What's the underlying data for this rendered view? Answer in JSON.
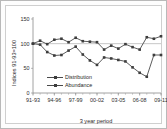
{
  "chart_data": {
    "type": "line",
    "title": "",
    "subtitle": "",
    "xlabel": "3 year period",
    "ylabel": "Indices 91-93=100",
    "ylim": [
      0,
      150
    ],
    "yticks": [
      0,
      50,
      100,
      150
    ],
    "ytick_labels": [
      "0",
      "50",
      "100",
      "150"
    ],
    "xtick_labels": [
      "91-93",
      "94-96",
      "97-99",
      "00-02",
      "03-05",
      "06-08",
      "09-11"
    ],
    "x": [
      "91-93",
      "92-94",
      "93-95",
      "94-96",
      "95-97",
      "96-98",
      "97-99",
      "98-00",
      "99-01",
      "00-02",
      "01-03",
      "02-04",
      "03-05",
      "04-06",
      "05-07",
      "06-08",
      "07-09",
      "08-10",
      "09-11"
    ],
    "grid": "reference line at 100",
    "legend_position": "inside-lower-left",
    "reference_value": 100,
    "series": [
      {
        "name": "Distribution",
        "color": "#4a4a4a",
        "marker": "square",
        "values": [
          100,
          106,
          99,
          108,
          110,
          103,
          112,
          105,
          104,
          103,
          88,
          96,
          90,
          99,
          93,
          88,
          113,
          110,
          115
        ]
      },
      {
        "name": "Abundance",
        "color": "#4a4a4a",
        "marker": "square",
        "values": [
          100,
          98,
          83,
          76,
          77,
          86,
          94,
          78,
          66,
          57,
          72,
          70,
          67,
          64,
          52,
          41,
          33,
          77,
          77
        ]
      }
    ]
  },
  "legend": {
    "items": [
      {
        "label": "Distribution"
      },
      {
        "label": "Abundance"
      }
    ]
  },
  "axes": {
    "y_title": "Indices 91-93=100",
    "x_title": "3 year period"
  }
}
